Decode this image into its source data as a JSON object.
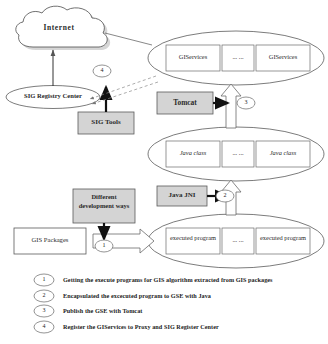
{
  "figure": {
    "type": "architecture-flow-diagram",
    "background_color": "#ffffff",
    "box_fill_shaded": "#d4d4d4",
    "box_fill_plain": "#ffffff",
    "stroke_color": "#4a4a4a"
  },
  "nodes": {
    "internet": {
      "label": "Internet",
      "shape": "cloud"
    },
    "sig_registry_center": {
      "label": "SIG Registry Center",
      "shape": "ellipse"
    },
    "sig_tools": {
      "label": "SIG Tools",
      "shape": "rect-shaded"
    },
    "tomcat": {
      "label": "Tomcat",
      "shape": "rect-shaded"
    },
    "java_jni": {
      "label": "Java JNI",
      "shape": "rect-shaded"
    },
    "different_development_ways": {
      "label": "Different development ways",
      "shape": "rect-shaded"
    },
    "gis_packages": {
      "label": "GIS Packages",
      "shape": "rect-plain"
    }
  },
  "groups": [
    {
      "id": "giservices-group",
      "shape": "ellipse",
      "items": [
        {
          "label": "GIServices"
        },
        {
          "label": "... ..."
        },
        {
          "label": "GIServices"
        }
      ]
    },
    {
      "id": "javaclass-group",
      "shape": "ellipse",
      "items": [
        {
          "label": "Java class"
        },
        {
          "label": "... ..."
        },
        {
          "label": "Java class"
        }
      ]
    },
    {
      "id": "executed-program-group",
      "shape": "ellipse",
      "items": [
        {
          "label": "executed program"
        },
        {
          "label": "... ..."
        },
        {
          "label": "executed program"
        }
      ]
    }
  ],
  "step_markers": [
    {
      "id": "marker-1",
      "number": "1"
    },
    {
      "id": "marker-2",
      "number": "2"
    },
    {
      "id": "marker-3",
      "number": "3"
    },
    {
      "id": "marker-4",
      "number": "4"
    }
  ],
  "legend": [
    {
      "number": "1",
      "text": "Getting the execute programs for GIS algorithm  extracted from GIS packages"
    },
    {
      "number": "2",
      "text": "Encapsulated the excecuted program to GSE with Java"
    },
    {
      "number": "3",
      "text": "Publish the GSE with Tomcat"
    },
    {
      "number": "4",
      "text": "Register the GIServices to Proxy and SIG Register Center"
    }
  ]
}
